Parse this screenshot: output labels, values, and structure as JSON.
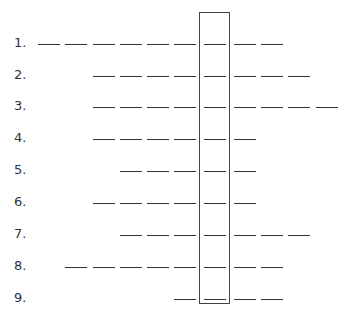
{
  "puzzle": {
    "layout": {
      "row_tops": [
        35,
        67,
        98,
        130,
        162,
        194,
        226,
        258,
        290
      ],
      "blank_positions_x": [
        38,
        65,
        93,
        120,
        147,
        174,
        204,
        234,
        261,
        288,
        316
      ],
      "highlight_column_index": 6
    },
    "rows": [
      {
        "label": "1.",
        "start": 0,
        "end": 8
      },
      {
        "label": "2.",
        "start": 2,
        "end": 9
      },
      {
        "label": "3.",
        "start": 2,
        "end": 10
      },
      {
        "label": "4.",
        "start": 2,
        "end": 7
      },
      {
        "label": "5.",
        "start": 3,
        "end": 7
      },
      {
        "label": "6.",
        "start": 2,
        "end": 7
      },
      {
        "label": "7.",
        "start": 3,
        "end": 9
      },
      {
        "label": "8.",
        "start": 1,
        "end": 8
      },
      {
        "label": "9.",
        "start": 5,
        "end": 8
      }
    ]
  }
}
